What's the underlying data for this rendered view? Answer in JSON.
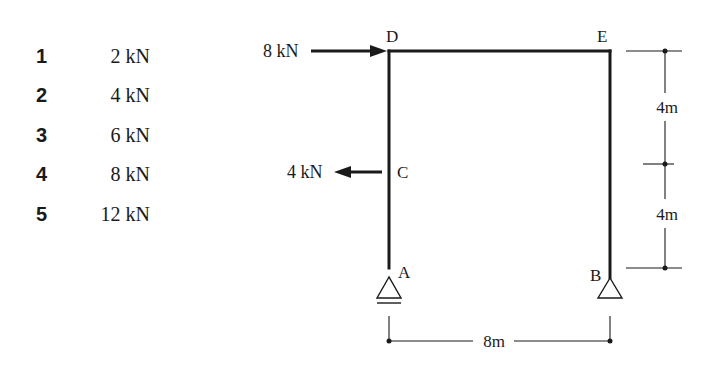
{
  "options": [
    {
      "number": "1",
      "value": "2 kN"
    },
    {
      "number": "2",
      "value": "4 kN"
    },
    {
      "number": "3",
      "value": "6 kN"
    },
    {
      "number": "4",
      "value": "8 kN"
    },
    {
      "number": "5",
      "value": "12 kN"
    }
  ],
  "frame": {
    "nodes": {
      "A": "A",
      "B": "B",
      "C": "C",
      "D": "D",
      "E": "E"
    },
    "loads": {
      "top": {
        "label": "8 kN",
        "node": "D",
        "direction": "right"
      },
      "middle": {
        "label": "4 kN",
        "node": "C",
        "direction": "left"
      }
    },
    "dimensions": {
      "span": "8m",
      "upper_height": "4m",
      "lower_height": "4m"
    },
    "supports": {
      "A": "roller",
      "B": "pin"
    }
  },
  "colors": {
    "ink": "#1a1a1a",
    "background": "#ffffff"
  }
}
